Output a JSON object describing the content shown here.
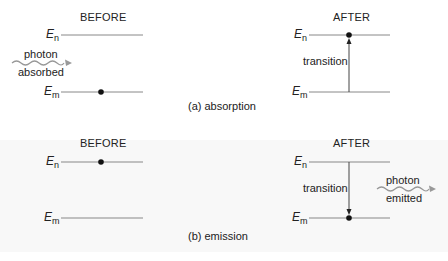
{
  "panels": [
    {
      "caption": "(a) absorption",
      "before": {
        "header": "BEFORE",
        "upper_label": "E",
        "upper_sub": "n",
        "lower_label": "E",
        "lower_sub": "m",
        "electron": "lower"
      },
      "after": {
        "header": "AFTER",
        "upper_label": "E",
        "upper_sub": "n",
        "lower_label": "E",
        "lower_sub": "m",
        "electron": "upper",
        "transition_label": "transition",
        "transition_direction": "up"
      },
      "photon": {
        "line1": "photon",
        "line2": "absorbed"
      }
    },
    {
      "caption": "(b) emission",
      "before": {
        "header": "BEFORE",
        "upper_label": "E",
        "upper_sub": "n",
        "lower_label": "E",
        "lower_sub": "m",
        "electron": "upper"
      },
      "after": {
        "header": "AFTER",
        "upper_label": "E",
        "upper_sub": "n",
        "lower_label": "E",
        "lower_sub": "m",
        "electron": "lower",
        "transition_label": "transition",
        "transition_direction": "down"
      },
      "photon": {
        "line1": "photon",
        "line2": "emitted"
      }
    }
  ],
  "colors": {
    "line": "#888888",
    "electron": "#111111",
    "wave": "#999999"
  }
}
